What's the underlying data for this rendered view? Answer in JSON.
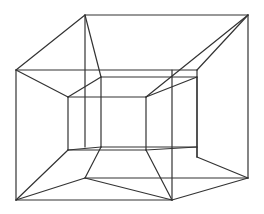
{
  "figure": {
    "stroke_color": "#333333",
    "background": "#ffffff",
    "segments": [
      [
        16,
        70,
        85,
        15
      ],
      [
        85,
        15,
        248,
        15
      ],
      [
        248,
        15,
        248,
        178
      ],
      [
        16,
        70,
        16,
        200
      ],
      [
        16,
        200,
        172,
        200
      ],
      [
        172,
        200,
        248,
        178
      ],
      [
        16,
        70,
        197,
        70
      ],
      [
        85,
        15,
        101,
        77
      ],
      [
        85,
        15,
        85,
        147
      ],
      [
        16,
        70,
        68,
        97
      ],
      [
        68,
        97,
        101,
        77
      ],
      [
        101,
        77,
        197,
        77
      ],
      [
        68,
        97,
        146,
        97
      ],
      [
        197,
        70,
        248,
        15
      ],
      [
        146,
        97,
        248,
        15
      ],
      [
        146,
        97,
        197,
        77
      ],
      [
        197,
        70,
        197,
        157
      ],
      [
        197,
        77,
        197,
        157
      ],
      [
        146,
        97,
        146,
        150
      ],
      [
        68,
        97,
        68,
        150
      ],
      [
        101,
        77,
        101,
        147
      ],
      [
        172,
        70,
        172,
        200
      ],
      [
        68,
        150,
        146,
        150
      ],
      [
        68,
        150,
        101,
        147
      ],
      [
        101,
        147,
        197,
        147
      ],
      [
        146,
        150,
        197,
        147
      ],
      [
        101,
        147,
        85,
        178
      ],
      [
        68,
        150,
        16,
        200
      ],
      [
        85,
        178,
        16,
        200
      ],
      [
        85,
        178,
        248,
        178
      ],
      [
        146,
        150,
        172,
        200
      ],
      [
        197,
        157,
        248,
        178
      ],
      [
        85,
        178,
        172,
        200
      ]
    ]
  }
}
